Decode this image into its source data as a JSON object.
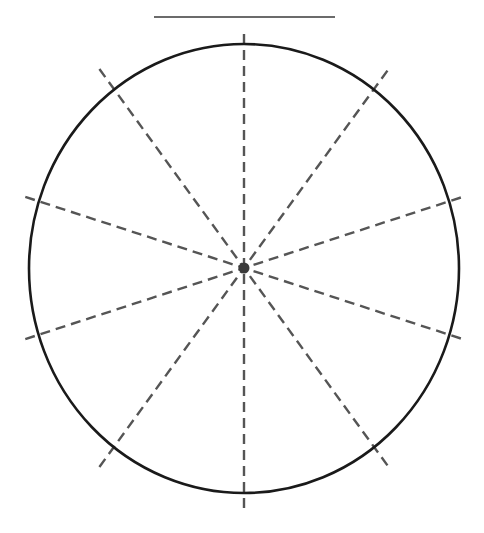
{
  "diagram": {
    "type": "circle-with-radial-dashed-lines",
    "canvas": {
      "width": 484,
      "height": 533
    },
    "top_line": {
      "x1": 154,
      "x2": 335,
      "y": 17,
      "color": "#3a3a3a",
      "width": 1.6
    },
    "circle": {
      "cx": 244,
      "cy": 268.5,
      "rx": 215,
      "ry": 224.5,
      "stroke": "#1a1a1a",
      "stroke_width": 2.6
    },
    "center_dot": {
      "cx": 244,
      "cy": 268,
      "r": 5.5,
      "color": "#3a3a3a"
    },
    "spokes": {
      "count": 10,
      "angles_deg_from_vertical": [
        0,
        36,
        72,
        108,
        144
      ],
      "half_lengths": [
        240,
        246,
        230,
        230,
        246
      ],
      "stroke": "#555555",
      "stroke_width": 2.4,
      "dash": "10 6"
    },
    "colors": {
      "background": "#ffffff",
      "circle": "#1a1a1a",
      "dashes": "#555555",
      "dot": "#3a3a3a"
    }
  }
}
